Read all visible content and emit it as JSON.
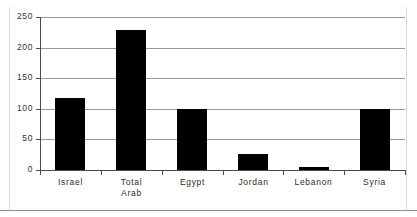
{
  "chart_data": {
    "type": "bar",
    "title": "",
    "xlabel": "",
    "ylabel": "",
    "categories": [
      "Israel",
      "Total Arab",
      "Egypt",
      "Jordan",
      "Lebanon",
      "Syria"
    ],
    "category_lines": [
      [
        "Israel"
      ],
      [
        "Total",
        "Arab"
      ],
      [
        "Egypt"
      ],
      [
        "Jordan"
      ],
      [
        "Lebanon"
      ],
      [
        "Syria"
      ]
    ],
    "values": [
      117,
      228,
      100,
      26,
      5,
      100
    ],
    "ylim": [
      0,
      250
    ],
    "ytick_values": [
      0,
      50,
      100,
      150,
      200,
      250
    ],
    "ytick_labels": [
      "0",
      "50",
      "100",
      "150",
      "200",
      "250"
    ],
    "grid": true,
    "legend": "none",
    "bar_color": "#000000",
    "gridline_color": "#9a9a9a",
    "axis_color": "#4a4a4a"
  },
  "figure": {
    "title_fragment": "",
    "background": "#ffffff"
  }
}
